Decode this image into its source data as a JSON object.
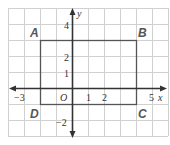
{
  "diagram": {
    "type": "coordinate-plane",
    "grid": {
      "x_min": -4,
      "x_max": 6,
      "y_min": -3,
      "y_max": 5,
      "cell_px": 16,
      "color": "#d0d0d0"
    },
    "axes": {
      "x_label": "x",
      "y_label": "y",
      "origin_label": "O",
      "x_ticks": [
        {
          "value": -3,
          "label": "−3"
        },
        {
          "value": 1,
          "label": "1"
        },
        {
          "value": 2,
          "label": "2"
        },
        {
          "value": 5,
          "label": "5"
        }
      ],
      "y_ticks": [
        {
          "value": 4,
          "label": "4"
        },
        {
          "value": 2,
          "label": "2"
        },
        {
          "value": 1,
          "label": "1"
        },
        {
          "value": -2,
          "label": "−2"
        }
      ],
      "color": "#333333"
    },
    "rectangle": {
      "vertices": [
        {
          "label": "A",
          "x": -2,
          "y": 3
        },
        {
          "label": "B",
          "x": 4,
          "y": 3
        },
        {
          "label": "C",
          "x": 4,
          "y": -1
        },
        {
          "label": "D",
          "x": -2,
          "y": -1
        }
      ],
      "stroke": "#555555"
    }
  }
}
